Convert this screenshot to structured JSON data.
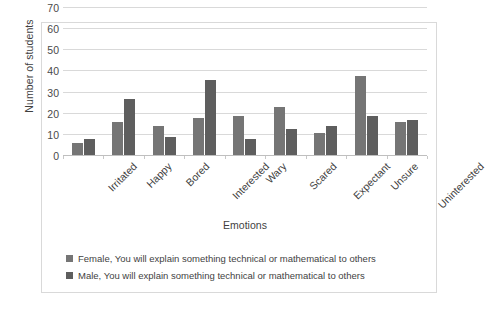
{
  "chart_data": {
    "type": "bar",
    "title": "",
    "xlabel": "Emotions",
    "ylabel": "Number of students",
    "ylim": [
      0,
      70
    ],
    "ytick_labels": [
      "70",
      "60",
      "50",
      "40",
      "30",
      "20",
      "10",
      "0"
    ],
    "ytick_values": [
      70,
      60,
      50,
      40,
      30,
      20,
      10,
      0
    ],
    "grid": true,
    "legend_position": "bottom-left",
    "categories": [
      "Irritated",
      "Happy",
      "Bored",
      "Interested",
      "Wary",
      "Scared",
      "Expectant",
      "Unsure",
      "Uninterested"
    ],
    "series": [
      {
        "name": "Female, You will explain something technical or mathematical to others",
        "color": "#757575",
        "values": [
          6,
          16,
          14,
          18,
          19,
          23,
          11,
          38,
          16
        ]
      },
      {
        "name": "Male, You will explain something technical or mathematical to others",
        "color": "#5e5e5e",
        "values": [
          8,
          27,
          9,
          36,
          8,
          13,
          14,
          19,
          17
        ]
      }
    ]
  },
  "legend": {
    "items": [
      {
        "marker": "square-marker",
        "label": "Female, You will explain something technical or mathematical to others"
      },
      {
        "marker": "square-marker",
        "label": "Male, You will explain something technical or mathematical to others"
      }
    ]
  }
}
